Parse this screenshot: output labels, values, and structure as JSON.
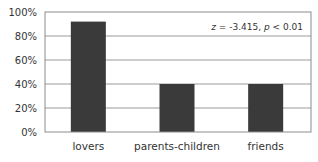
{
  "chart_data": {
    "type": "bar",
    "title": "",
    "xlabel": "",
    "ylabel": "",
    "categories": [
      "lovers",
      "parents-children",
      "friends"
    ],
    "values": [
      92,
      40,
      40
    ],
    "unit": "%",
    "ylim": [
      0,
      100
    ],
    "yticks": [
      "0%",
      "20%",
      "40%",
      "60%",
      "80%",
      "100%"
    ],
    "grid": true,
    "legend": null,
    "annotation": {
      "z_label": "z",
      "z_text": " = -3.415, ",
      "p_label": "p",
      "p_text": " < 0.01"
    },
    "colors": {
      "bar": "#3a3a3a",
      "grid": "#9a9a9a",
      "frame": "#8c8c8c"
    }
  }
}
